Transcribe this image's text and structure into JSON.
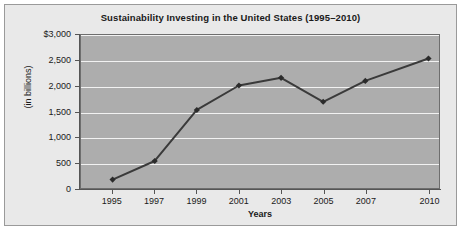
{
  "chart_data": {
    "type": "line",
    "title": "Sustainability Investing in the United States (1995–2010)",
    "xlabel": "Years",
    "ylabel": "(in billions)",
    "categories": [
      "1995",
      "1997",
      "1999",
      "2001",
      "2003",
      "2005",
      "2007",
      "2010"
    ],
    "values": [
      165,
      530,
      1530,
      2010,
      2160,
      1690,
      2100,
      2540
    ],
    "ylim": [
      0,
      3000
    ],
    "y_ticks": [
      0,
      500,
      1000,
      1500,
      2000,
      2500,
      3000
    ],
    "y_tick_labels": [
      "0",
      "500",
      "1,000",
      "1,500",
      "2,000",
      "2,500",
      "$3,000"
    ],
    "grid": true,
    "legend": "none",
    "series": [
      {
        "name": "Sustainability Investing",
        "values": [
          165,
          530,
          1530,
          2010,
          2160,
          1690,
          2100,
          2540
        ]
      }
    ],
    "colors": {
      "figure_background": "#e9e9e9",
      "plot_background": "#adadad",
      "gridline": "#f2f2f2",
      "line": "#3a3a3a",
      "marker": "#2b2b2b",
      "axis": "#555555",
      "text": "#1a1a1a"
    }
  }
}
